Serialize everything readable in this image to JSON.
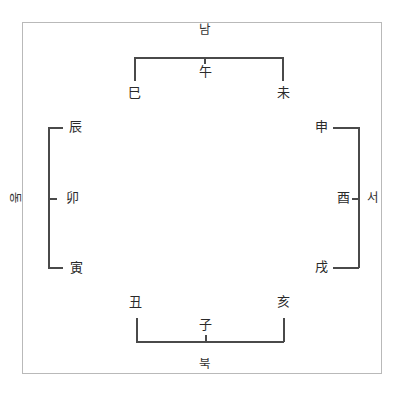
{
  "directions": {
    "south": "남",
    "north": "북",
    "east": "동",
    "west": "서"
  },
  "branches": {
    "top": {
      "left": "巳",
      "center": "午",
      "right": "未"
    },
    "left": {
      "top": "辰",
      "center": "卯",
      "bottom": "寅"
    },
    "right": {
      "top": "申",
      "center": "酉",
      "bottom": "戌"
    },
    "bottom": {
      "left": "丑",
      "center": "子",
      "right": "亥"
    }
  },
  "colors": {
    "frame": "#b9b9b9",
    "lines": "#4a4a4a",
    "text": "#2a2a2a"
  }
}
